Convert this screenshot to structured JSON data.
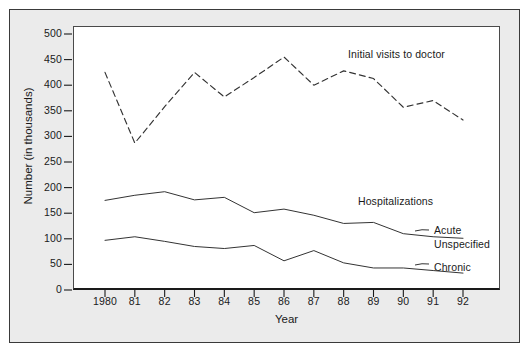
{
  "chart_data": {
    "type": "line",
    "title": "",
    "xlabel": "Year",
    "ylabel": "Number (in thousands)",
    "x": [
      1980,
      1981,
      1982,
      1983,
      1984,
      1985,
      1986,
      1987,
      1988,
      1989,
      1990,
      1991,
      1992
    ],
    "xtick_labels": [
      "1980",
      "81",
      "82",
      "83",
      "84",
      "85",
      "86",
      "87",
      "88",
      "89",
      "90",
      "91",
      "92"
    ],
    "ytick_labels": [
      "0",
      "50",
      "100",
      "150",
      "200",
      "250",
      "300",
      "350",
      "400",
      "450",
      "500"
    ],
    "ytick_values": [
      0,
      50,
      100,
      150,
      200,
      250,
      300,
      350,
      400,
      450,
      500
    ],
    "ylim": [
      0,
      500
    ],
    "grid": false,
    "legend_position": "inline-annotations",
    "series": [
      {
        "name": "Initial visits to doctor",
        "style": "dashed",
        "color": "#333333",
        "label_x": 1987.1,
        "label_y": 452,
        "values": [
          425,
          287,
          358,
          425,
          377,
          415,
          455,
          400,
          428,
          413,
          357,
          370,
          332
        ]
      },
      {
        "name": "Hospitalizations",
        "style": "solid",
        "color": "#333333",
        "label_x": 1988.3,
        "label_y": 152,
        "values": [
          175,
          185,
          192,
          176,
          181,
          151,
          158,
          146,
          130,
          132,
          110,
          104,
          101
        ]
      },
      {
        "name": "Acute Unspecified",
        "style": "solid",
        "color": "#333333",
        "values": [
          97,
          104,
          95,
          85,
          81,
          87,
          57,
          77,
          53,
          43,
          43,
          38,
          33
        ]
      }
    ],
    "annotations": [
      {
        "text": "Initial visits to doctor",
        "target": "series-0"
      },
      {
        "text": "Hospitalizations",
        "target": "series-1"
      },
      {
        "text": "Acute",
        "target": "series-2-line1"
      },
      {
        "text": "Unspecified",
        "target": "series-2-line2"
      },
      {
        "text": "Chronic",
        "target": "series-3"
      }
    ]
  },
  "axis": {
    "y_label": "Number (in thousands)",
    "x_label": "Year",
    "y_ticks": [
      "500",
      "450",
      "400",
      "350",
      "300",
      "250",
      "200",
      "150",
      "100",
      "50",
      "0"
    ],
    "x_ticks": [
      "1980",
      "81",
      "82",
      "83",
      "84",
      "85",
      "86",
      "87",
      "88",
      "89",
      "90",
      "91",
      "92"
    ]
  },
  "annotations": {
    "initial_visits": "Initial visits to doctor",
    "hospitalizations": "Hospitalizations",
    "acute": "Acute",
    "unspecified": "Unspecified",
    "chronic": "Chronic"
  },
  "colors": {
    "line": "#333333",
    "axis": "#1a1a1a",
    "plot_background": "#ffffff",
    "mat_background": "#ebebeb",
    "frame": "#3a3a3a"
  }
}
